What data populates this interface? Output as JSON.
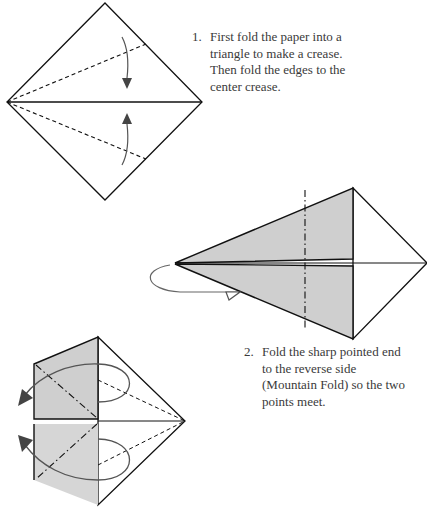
{
  "steps": [
    {
      "number": "1.",
      "lines": [
        "First fold the paper into a",
        "triangle to make a crease.",
        "Then fold the edges to the",
        "center crease."
      ]
    },
    {
      "number": "2.",
      "lines": [
        "Fold the sharp pointed end",
        "to the reverse side",
        "(Mountain Fold) so the two",
        "points meet."
      ]
    }
  ],
  "colors": {
    "line": "#111111",
    "shade": "#cfcfcf",
    "arrow": "#555555"
  }
}
